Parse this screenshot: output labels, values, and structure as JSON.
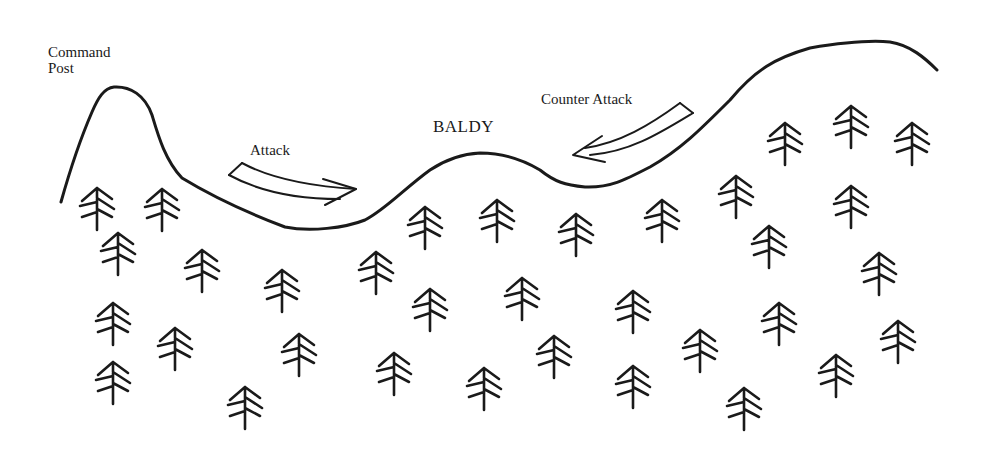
{
  "labels": {
    "command_post_line1": "Command",
    "command_post_line2": "Post",
    "attack": "Attack",
    "baldy": "BALDY",
    "counter_attack": "Counter Attack"
  },
  "colors": {
    "stroke": "#1a1a1a",
    "background": "#ffffff"
  },
  "diagram": {
    "type": "terrain-sketch",
    "features": [
      "Command Post hill",
      "Attack arrow (left to right)",
      "BALDY hill",
      "Counter Attack arrow (right to left)",
      "forest of pine trees"
    ],
    "tree_count": 34,
    "trees": [
      [
        97,
        188
      ],
      [
        162,
        189
      ],
      [
        118,
        233
      ],
      [
        202,
        250
      ],
      [
        282,
        270
      ],
      [
        113,
        303
      ],
      [
        175,
        328
      ],
      [
        113,
        362
      ],
      [
        299,
        334
      ],
      [
        245,
        387
      ],
      [
        425,
        207
      ],
      [
        497,
        200
      ],
      [
        576,
        214
      ],
      [
        662,
        200
      ],
      [
        376,
        252
      ],
      [
        430,
        289
      ],
      [
        522,
        278
      ],
      [
        633,
        291
      ],
      [
        394,
        353
      ],
      [
        484,
        368
      ],
      [
        554,
        336
      ],
      [
        633,
        366
      ],
      [
        736,
        176
      ],
      [
        769,
        226
      ],
      [
        851,
        186
      ],
      [
        879,
        253
      ],
      [
        779,
        303
      ],
      [
        898,
        321
      ],
      [
        700,
        330
      ],
      [
        836,
        355
      ],
      [
        744,
        388
      ],
      [
        785,
        123
      ],
      [
        851,
        106
      ],
      [
        912,
        123
      ]
    ]
  }
}
